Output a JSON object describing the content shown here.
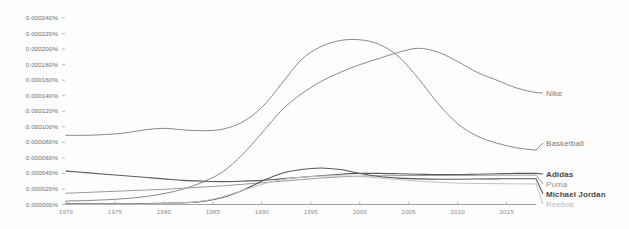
{
  "chart_data": {
    "type": "line",
    "title": "",
    "xlabel": "",
    "ylabel": "",
    "xlim": [
      1970,
      2018
    ],
    "ylim": [
      0.0,
      0.00024
    ],
    "grid": false,
    "legend_position": "right-inline",
    "x_ticks": [
      "1970",
      "1975",
      "1980",
      "1985",
      "1990",
      "1995",
      "2000",
      "2005",
      "2010",
      "2015"
    ],
    "y_ticks": [
      "0.000240%",
      "0.000220%",
      "0.000200%",
      "0.000180%",
      "0.000160%",
      "0.000140%",
      "0.000120%",
      "0.000100%",
      "0.000080%",
      "0.000060%",
      "0.000040%",
      "0.000020%",
      "0.000000%"
    ],
    "x": [
      1970,
      1972,
      1974,
      1976,
      1978,
      1980,
      1982,
      1984,
      1986,
      1988,
      1990,
      1992,
      1994,
      1996,
      1998,
      2000,
      2002,
      2004,
      2006,
      2008,
      2010,
      2012,
      2014,
      2016,
      2018
    ],
    "series": [
      {
        "name": "Nike",
        "color": "#8a8a8a",
        "width": 1.0,
        "label": "Nike",
        "values": [
          4.5e-06,
          5e-06,
          6e-06,
          7.5e-06,
          1e-05,
          1.4e-05,
          2e-05,
          2.9e-05,
          4.2e-05,
          6.4e-05,
          9.2e-05,
          0.000121,
          0.000142,
          0.000158,
          0.00017,
          0.00018,
          0.000188,
          0.000196,
          0.000201,
          0.000196,
          0.000184,
          0.00017,
          0.00016,
          0.00015,
          0.000144
        ]
      },
      {
        "name": "Basketball",
        "color": "#8a8a8a",
        "width": 1.0,
        "label": "Basketball",
        "values": [
          8.9e-05,
          8.9e-05,
          9e-05,
          9.2e-05,
          9.6e-05,
          9.8e-05,
          9.6e-05,
          9.5e-05,
          9.7e-05,
          0.000106,
          0.000125,
          0.000155,
          0.000186,
          0.000203,
          0.000211,
          0.000212,
          0.000206,
          0.00019,
          0.000162,
          0.00013,
          0.000104,
          8.8e-05,
          7.9e-05,
          7.3e-05,
          7e-05
        ]
      },
      {
        "name": "Adidas",
        "color": "#5a5a5a",
        "width": 1.1,
        "label": "Adidas",
        "values": [
          4.3e-05,
          4.1e-05,
          3.9e-05,
          3.7e-05,
          3.5e-05,
          3.3e-05,
          3.1e-05,
          3e-05,
          2.95e-05,
          3e-05,
          3.1e-05,
          3.3e-05,
          3.5e-05,
          3.7e-05,
          3.9e-05,
          4e-05,
          4e-05,
          3.95e-05,
          3.9e-05,
          3.85e-05,
          3.85e-05,
          3.9e-05,
          3.95e-05,
          4e-05,
          4e-05
        ]
      },
      {
        "name": "Puma",
        "color": "#9a9a9a",
        "width": 1.0,
        "label": "Puma",
        "values": [
          1.45e-05,
          1.55e-05,
          1.65e-05,
          1.75e-05,
          1.85e-05,
          1.95e-05,
          2.1e-05,
          2.25e-05,
          2.4e-05,
          2.6e-05,
          2.8e-05,
          3e-05,
          3.2e-05,
          3.4e-05,
          3.55e-05,
          3.65e-05,
          3.7e-05,
          3.72e-05,
          3.73e-05,
          3.74e-05,
          3.75e-05,
          3.76e-05,
          3.77e-05,
          3.78e-05,
          3.78e-05
        ]
      },
      {
        "name": "Michael Jordan",
        "color": "#5a5a5a",
        "width": 1.1,
        "label": "Michael Jordan",
        "values": [
          8e-07,
          8e-07,
          9e-07,
          1e-06,
          1.2e-06,
          1.6e-06,
          2.2e-06,
          4e-06,
          9e-06,
          1.8e-05,
          3e-05,
          4e-05,
          4.5e-05,
          4.7e-05,
          4.5e-05,
          4e-05,
          3.6e-05,
          3.4e-05,
          3.3e-05,
          3.25e-05,
          3.25e-05,
          3.28e-05,
          3.3e-05,
          3.32e-05,
          3.32e-05
        ]
      },
      {
        "name": "Reebok",
        "color": "#c2c2c2",
        "width": 1.0,
        "label": "Reebok",
        "values": [
          2e-07,
          2e-07,
          3e-07,
          4e-07,
          6e-07,
          1e-06,
          2e-06,
          4.5e-06,
          1e-05,
          1.8e-05,
          2.6e-05,
          3.2e-05,
          3.5e-05,
          3.65e-05,
          3.68e-05,
          3.6e-05,
          3.4e-05,
          3.2e-05,
          3e-05,
          2.85e-05,
          2.75e-05,
          2.7e-05,
          2.68e-05,
          2.66e-05,
          2.65e-05
        ]
      }
    ]
  },
  "axes": {
    "baseline_color": "#8c8c8c",
    "tick_color": "#9a9a9a"
  }
}
